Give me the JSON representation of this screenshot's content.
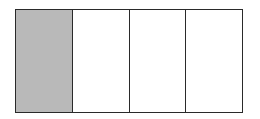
{
  "diagram": {
    "type": "fraction-bar",
    "total_parts": 4,
    "shaded_parts": 1,
    "parts": [
      {
        "index": 0,
        "shaded": true
      },
      {
        "index": 1,
        "shaded": false
      },
      {
        "index": 2,
        "shaded": false
      },
      {
        "index": 3,
        "shaded": false
      }
    ],
    "colors": {
      "shaded_fill": "#b9b9b9",
      "unshaded_fill": "#ffffff",
      "border": "#2a2a2a"
    }
  }
}
